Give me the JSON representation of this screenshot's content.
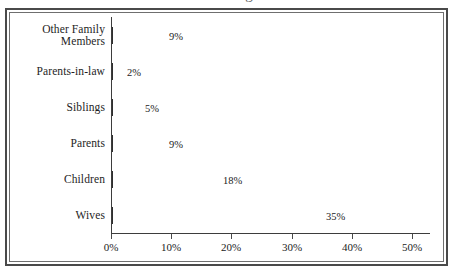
{
  "figure": {
    "background_color": "#ffffff",
    "frame_color": "#4a4a4a",
    "title_clipped": "Percentage"
  },
  "chart_data": {
    "type": "bar",
    "orientation": "horizontal",
    "title": "",
    "xlabel": "",
    "ylabel": "",
    "categories": [
      "Wives",
      "Children",
      "Parents",
      "Siblings",
      "Parents-in-law",
      "Other Family\nMembers"
    ],
    "values": [
      35,
      18,
      9,
      5,
      2,
      9
    ],
    "data_labels": [
      "35%",
      "18%",
      "9%",
      "5%",
      "2%",
      "9%"
    ],
    "xlim": [
      0,
      50
    ],
    "xticks": [
      0,
      10,
      20,
      30,
      40,
      50
    ],
    "xticklabels": [
      "0%",
      "10%",
      "20%",
      "30%",
      "40%",
      "50%"
    ],
    "grid": false,
    "legend": false,
    "bar_color": "#4a4a4a",
    "bar_gradient": [
      "#d9d9d9",
      "#3a3a3a"
    ]
  },
  "axes": {
    "x_axis_name": "percentage-axis",
    "y_axis_name": "category-axis"
  }
}
